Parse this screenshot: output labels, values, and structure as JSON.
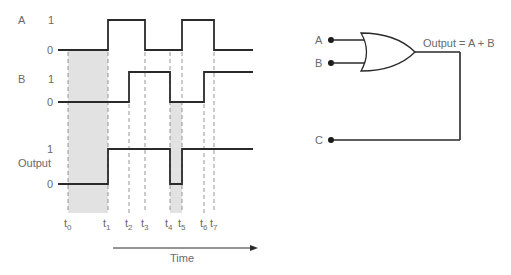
{
  "timing_diagram": {
    "signals": [
      {
        "name": "A",
        "high_label": "1",
        "low_label": "0",
        "transitions": [
          "low",
          "t1:high",
          "t3:low",
          "t5:high",
          "t7:low"
        ]
      },
      {
        "name": "B",
        "high_label": "1",
        "low_label": "0",
        "transitions": [
          "low",
          "t2:high",
          "t4:low",
          "t6:high"
        ]
      },
      {
        "name": "Output",
        "high_label": "1",
        "low_label": "0",
        "transitions": [
          "low",
          "t1:high",
          "t4:low",
          "t5:high"
        ]
      }
    ],
    "time_markers": [
      "t0",
      "t1",
      "t2",
      "t3",
      "t4",
      "t5",
      "t6",
      "t7"
    ],
    "time_marker_base": "t",
    "time_marker_subs": [
      "0",
      "1",
      "2",
      "3",
      "4",
      "5",
      "6",
      "7"
    ],
    "shaded_intervals": [
      [
        "t0",
        "t1"
      ],
      [
        "t4",
        "t5"
      ]
    ],
    "axis_label": "Time"
  },
  "labels": {
    "a": "A",
    "b": "B",
    "output": "Output",
    "one": "1",
    "zero": "0"
  },
  "circuit": {
    "gate_type": "OR",
    "inputs": [
      "A",
      "B"
    ],
    "output_expression": "Output = A + B",
    "probe_label": "C"
  },
  "colors": {
    "line": "#2a2a2a",
    "shade": "#e2e2e2",
    "text": "#6a6a6a",
    "dash": "#8a8a8a"
  }
}
